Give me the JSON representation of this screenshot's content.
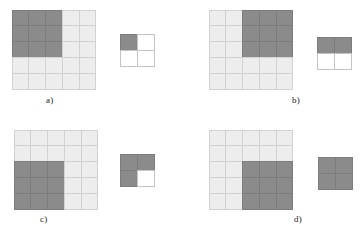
{
  "figure": {
    "type": "diagram",
    "colors": {
      "filled": "#8b8b8b",
      "empty": "#ededed",
      "blank": "#ffffff",
      "gridline": "#c9c9c9",
      "label_text": "#1b1b1b",
      "background": "#ffffff"
    },
    "grid_big": {
      "rows": 5,
      "cols": 5
    },
    "grid_small": {
      "rows": 2,
      "cols": 2
    }
  },
  "panels": [
    {
      "id": "a",
      "label": "a)",
      "region": "top-left",
      "big": [
        [
          "dark",
          "dark",
          "dark",
          "light",
          "light"
        ],
        [
          "dark",
          "dark",
          "dark",
          "light",
          "light"
        ],
        [
          "dark",
          "dark",
          "dark",
          "light",
          "light"
        ],
        [
          "light",
          "light",
          "light",
          "light",
          "light"
        ],
        [
          "light",
          "light",
          "light",
          "light",
          "light"
        ]
      ],
      "small": [
        [
          "dark",
          "white"
        ],
        [
          "white",
          "white"
        ]
      ]
    },
    {
      "id": "b",
      "label": "b)",
      "region": "top-right",
      "big": [
        [
          "light",
          "light",
          "dark",
          "dark",
          "dark"
        ],
        [
          "light",
          "light",
          "dark",
          "dark",
          "dark"
        ],
        [
          "light",
          "light",
          "dark",
          "dark",
          "dark"
        ],
        [
          "light",
          "light",
          "light",
          "light",
          "light"
        ],
        [
          "light",
          "light",
          "light",
          "light",
          "light"
        ]
      ],
      "small": [
        [
          "dark",
          "dark"
        ],
        [
          "white",
          "white"
        ]
      ]
    },
    {
      "id": "c",
      "label": "c)",
      "region": "bottom-left",
      "big": [
        [
          "light",
          "light",
          "light",
          "light",
          "light"
        ],
        [
          "light",
          "light",
          "light",
          "light",
          "light"
        ],
        [
          "dark",
          "dark",
          "dark",
          "light",
          "light"
        ],
        [
          "dark",
          "dark",
          "dark",
          "light",
          "light"
        ],
        [
          "dark",
          "dark",
          "dark",
          "light",
          "light"
        ]
      ],
      "small": [
        [
          "dark",
          "dark"
        ],
        [
          "dark",
          "white"
        ]
      ]
    },
    {
      "id": "d",
      "label": "d)",
      "region": "bottom-right",
      "big": [
        [
          "light",
          "light",
          "light",
          "light",
          "light"
        ],
        [
          "light",
          "light",
          "light",
          "light",
          "light"
        ],
        [
          "light",
          "light",
          "dark",
          "dark",
          "dark"
        ],
        [
          "light",
          "light",
          "dark",
          "dark",
          "dark"
        ],
        [
          "light",
          "light",
          "dark",
          "dark",
          "dark"
        ]
      ],
      "small": [
        [
          "dark",
          "dark"
        ],
        [
          "dark",
          "dark"
        ]
      ]
    }
  ]
}
